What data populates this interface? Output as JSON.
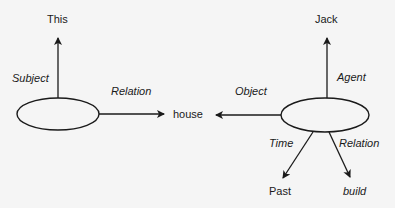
{
  "diagram": {
    "type": "semantic-network",
    "nodes": {
      "this": "This",
      "house": "house",
      "jack": "Jack",
      "past": "Past",
      "build": "build"
    },
    "edges": {
      "left_subject": "Subject",
      "left_relation": "Relation",
      "right_object": "Object",
      "right_agent": "Agent",
      "right_time": "Time",
      "right_relation": "Relation"
    },
    "colors": {
      "stroke": "#1a1a1a",
      "background": "#f5f5f5"
    }
  }
}
